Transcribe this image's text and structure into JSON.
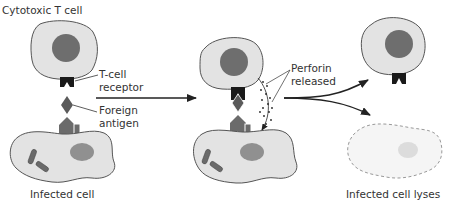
{
  "labels": {
    "cytotoxic_t_cell": "Cytotoxic T cell",
    "t_cell_receptor_line1": "T-cell",
    "t_cell_receptor_line2": "receptor",
    "foreign_antigen_line1": "Foreign",
    "foreign_antigen_line2": "antigen",
    "infected_cell": "Infected cell",
    "perforin_line1": "Perforin",
    "perforin_line2": "released",
    "infected_cell_lyses": "Infected cell lyses"
  },
  "stages": [
    {
      "name": "recognition",
      "description": "T-cell receptor binds foreign antigen on infected cell"
    },
    {
      "name": "perforin-release",
      "description": "T cell releases perforin onto infected cell"
    },
    {
      "name": "outcome",
      "description": "T cell survives; infected cell lyses"
    }
  ],
  "colors": {
    "cell_fill": "#e3e3e3",
    "cell_stroke": "#555555",
    "nucleus_fill": "#6e6e6e",
    "receptor_fill": "#1a1a1a",
    "antigen_fill": "#5a5a5a",
    "mhc_fill": "#6b6b6b",
    "bacteria_fill": "#6a6a6a",
    "infected_nucleus_fill": "#909090",
    "lysed_cell_fill": "#f5f5f5",
    "lysed_nucleus_fill": "#dcdcdc",
    "arrow": "#222222",
    "text": "#333333"
  }
}
